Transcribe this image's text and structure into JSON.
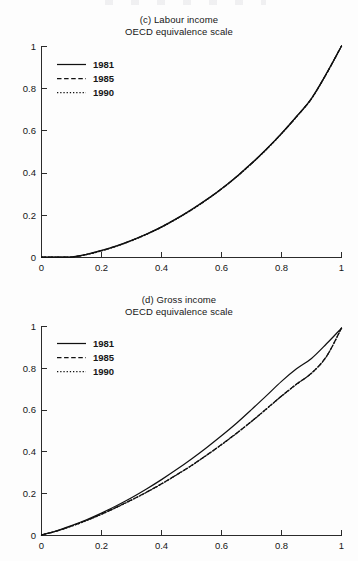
{
  "figure": {
    "background_color": "#fdfdfd",
    "ink_color": "#111111",
    "panels": [
      {
        "key": "c",
        "title_line1": "(c) Labour income",
        "title_line2": "OECD equivalence scale"
      },
      {
        "key": "d",
        "title_line1": "(d) Gross income",
        "title_line2": "OECD equivalence scale"
      }
    ],
    "legend_entries": [
      {
        "label": "1981",
        "style": "solid"
      },
      {
        "label": "1985",
        "style": "dashed"
      },
      {
        "label": "1990",
        "style": "dotted"
      }
    ]
  },
  "axis_labels": {
    "x": [
      "0",
      "0.2",
      "0.4",
      "0.6",
      "0.8",
      "1"
    ],
    "y": [
      "0",
      "0.2",
      "0.4",
      "0.6",
      "0.8",
      "1"
    ]
  },
  "chart_data": [
    {
      "type": "line",
      "title": "(c) Labour income — OECD equivalence scale",
      "subtitle": "OECD equivalence scale",
      "xlabel": "",
      "ylabel": "",
      "xlim": [
        0,
        1
      ],
      "ylim": [
        0,
        1
      ],
      "xticks": [
        0,
        0.2,
        0.4,
        0.6,
        0.8,
        1
      ],
      "yticks": [
        0,
        0.2,
        0.4,
        0.6,
        0.8,
        1
      ],
      "grid": false,
      "legend_position": "upper-left",
      "x": [
        0,
        0.05,
        0.1,
        0.15,
        0.2,
        0.25,
        0.3,
        0.35,
        0.4,
        0.45,
        0.5,
        0.55,
        0.6,
        0.65,
        0.7,
        0.75,
        0.8,
        0.85,
        0.9,
        0.95,
        1
      ],
      "series": [
        {
          "name": "1981",
          "style": "solid",
          "values": [
            0,
            0,
            0,
            0.013,
            0.031,
            0.053,
            0.079,
            0.109,
            0.143,
            0.182,
            0.225,
            0.272,
            0.324,
            0.381,
            0.444,
            0.512,
            0.586,
            0.666,
            0.752,
            0.87,
            1
          ]
        },
        {
          "name": "1985",
          "style": "dashed",
          "values": [
            0,
            0,
            0,
            0.012,
            0.03,
            0.052,
            0.078,
            0.108,
            0.142,
            0.181,
            0.224,
            0.271,
            0.323,
            0.38,
            0.443,
            0.511,
            0.585,
            0.665,
            0.751,
            0.869,
            1
          ]
        },
        {
          "name": "1990",
          "style": "dotted",
          "values": [
            0,
            0,
            0,
            0.011,
            0.029,
            0.051,
            0.077,
            0.107,
            0.141,
            0.18,
            0.223,
            0.27,
            0.322,
            0.379,
            0.442,
            0.51,
            0.584,
            0.664,
            0.75,
            0.868,
            1
          ]
        }
      ],
      "annotations": [
        "All three year curves are essentially coincident across the full range",
        "Curves are flat at zero until approximately x = 0.10"
      ]
    },
    {
      "type": "line",
      "title": "(d) Gross income — OECD equivalence scale",
      "subtitle": "OECD equivalence scale",
      "xlabel": "",
      "ylabel": "",
      "xlim": [
        0,
        1
      ],
      "ylim": [
        0,
        1
      ],
      "xticks": [
        0,
        0.2,
        0.4,
        0.6,
        0.8,
        1
      ],
      "yticks": [
        0,
        0.2,
        0.4,
        0.6,
        0.8,
        1
      ],
      "grid": false,
      "legend_position": "upper-left",
      "x": [
        0,
        0.05,
        0.1,
        0.15,
        0.2,
        0.25,
        0.3,
        0.35,
        0.4,
        0.45,
        0.5,
        0.55,
        0.6,
        0.65,
        0.7,
        0.75,
        0.8,
        0.85,
        0.9,
        0.95,
        1
      ],
      "series": [
        {
          "name": "1981",
          "style": "solid",
          "values": [
            0,
            0.02,
            0.045,
            0.073,
            0.105,
            0.14,
            0.178,
            0.22,
            0.265,
            0.313,
            0.364,
            0.418,
            0.475,
            0.535,
            0.6,
            0.667,
            0.735,
            0.795,
            0.845,
            0.915,
            0.99
          ]
        },
        {
          "name": "1985",
          "style": "dashed",
          "values": [
            0,
            0.019,
            0.043,
            0.07,
            0.1,
            0.133,
            0.168,
            0.205,
            0.245,
            0.288,
            0.333,
            0.382,
            0.433,
            0.487,
            0.544,
            0.604,
            0.665,
            0.722,
            0.775,
            0.855,
            0.99
          ]
        },
        {
          "name": "1990",
          "style": "dotted",
          "values": [
            0,
            0.019,
            0.042,
            0.069,
            0.099,
            0.132,
            0.167,
            0.204,
            0.244,
            0.287,
            0.332,
            0.381,
            0.432,
            0.486,
            0.543,
            0.603,
            0.664,
            0.721,
            0.774,
            0.854,
            0.99
          ]
        }
      ],
      "annotations": [
        "1981 lies above 1985/1990 from about x = 0.27 onward",
        "1985 and 1990 overlap each other closely",
        "All curves converge near x = 1"
      ]
    }
  ]
}
